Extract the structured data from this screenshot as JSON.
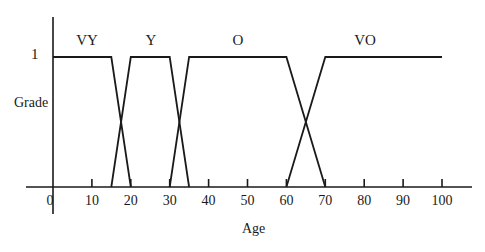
{
  "chart_data": {
    "type": "line",
    "title": "",
    "xlabel": "Age",
    "ylabel": "Grade",
    "xlim": [
      0,
      100
    ],
    "ylim": [
      0,
      1
    ],
    "y_tick_labels": [
      "1"
    ],
    "x_ticks": [
      0,
      10,
      20,
      30,
      40,
      50,
      60,
      70,
      80,
      90,
      100
    ],
    "x_tick_labels": [
      "0",
      "10",
      "20",
      "30",
      "40",
      "50",
      "60",
      "70",
      "80",
      "90",
      "100"
    ],
    "grid": false,
    "legend": "none (sets labeled above each membership function)",
    "series": [
      {
        "name": "VY",
        "label": "VY",
        "x": [
          0,
          15,
          20
        ],
        "y": [
          1,
          1,
          0
        ]
      },
      {
        "name": "Y",
        "label": "Y",
        "x": [
          15,
          20,
          30,
          35
        ],
        "y": [
          0,
          1,
          1,
          0
        ]
      },
      {
        "name": "O",
        "label": "O",
        "x": [
          30,
          35,
          60,
          70
        ],
        "y": [
          0,
          1,
          1,
          0
        ]
      },
      {
        "name": "VO",
        "label": "VO",
        "x": [
          60,
          70,
          100
        ],
        "y": [
          0,
          1,
          1
        ]
      }
    ]
  },
  "labels": {
    "xlabel": "Age",
    "ylabel": "Grade",
    "ytop": "1",
    "sets": [
      "VY",
      "Y",
      "O",
      "VO"
    ]
  }
}
